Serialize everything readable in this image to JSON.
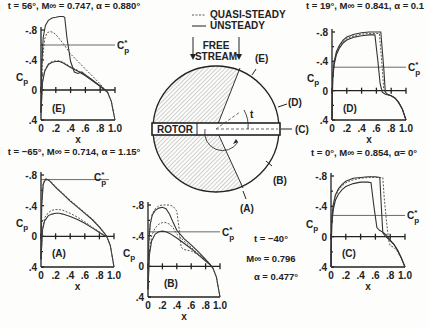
{
  "legend": {
    "quasi_steady": "QUASI-STEADY",
    "unsteady": "UNSTEADY"
  },
  "diagram": {
    "free_stream_line1": "FREE",
    "free_stream_line2": "STREAM",
    "rotor_label": "ROTOR",
    "azimuth_label": "t",
    "stations": [
      "(A)",
      "(B)",
      "(C)",
      "(D)",
      "(E)"
    ]
  },
  "chart_data": [
    {
      "type": "line",
      "panel": "(E)",
      "title": "t = 56°, M∞ = 0.747, α = 0.880°",
      "xlabel": "x",
      "ylabel": "Cp",
      "xlim": [
        0,
        1.0
      ],
      "ylim": [
        0.4,
        -0.8
      ],
      "xticks": [
        "0",
        ".2",
        ".4",
        ".6",
        ".8",
        "1.0"
      ],
      "yticks": [
        "-.8",
        "-.4",
        "0",
        ".4"
      ],
      "cp_star": -0.6,
      "cp_star_label": "C*p",
      "series": [
        {
          "name": "UNSTEADY upper",
          "x": [
            0,
            0.01,
            0.03,
            0.06,
            0.1,
            0.15,
            0.2,
            0.25,
            0.3,
            0.32,
            0.35,
            0.4,
            0.45,
            0.5,
            0.55,
            0.6,
            0.7,
            0.8,
            0.85,
            0.9,
            0.95,
            1.0
          ],
          "y": [
            0.3,
            -0.3,
            -0.7,
            -0.86,
            -0.93,
            -0.96,
            -0.97,
            -0.98,
            -0.98,
            -0.97,
            -0.7,
            -0.38,
            -0.24,
            -0.22,
            -0.24,
            -0.2,
            -0.13,
            -0.05,
            -0.01,
            0.03,
            0.15,
            0.4
          ]
        },
        {
          "name": "QUASI-STEADY upper",
          "x": [
            0,
            0.02,
            0.05,
            0.08,
            0.12,
            0.16,
            0.2,
            0.3,
            0.4,
            0.5,
            0.6,
            0.7,
            0.8,
            0.85,
            0.9,
            0.95,
            1.0
          ],
          "y": [
            0.3,
            -0.4,
            -0.68,
            -0.76,
            -0.78,
            -0.77,
            -0.74,
            -0.62,
            -0.48,
            -0.38,
            -0.28,
            -0.18,
            -0.08,
            -0.02,
            0.03,
            0.15,
            0.4
          ]
        },
        {
          "name": "UNSTEADY lower",
          "x": [
            0,
            0.02,
            0.05,
            0.1,
            0.15,
            0.2,
            0.25,
            0.3,
            0.4,
            0.5,
            0.6,
            0.7,
            0.8,
            0.85,
            0.9
          ],
          "y": [
            0.3,
            -0.1,
            -0.25,
            -0.34,
            -0.37,
            -0.38,
            -0.38,
            -0.36,
            -0.3,
            -0.25,
            -0.19,
            -0.12,
            -0.05,
            -0.01,
            0.03
          ]
        },
        {
          "name": "QUASI-STEADY lower",
          "x": [
            0,
            0.02,
            0.05,
            0.1,
            0.15,
            0.2,
            0.25,
            0.3,
            0.4,
            0.5,
            0.6,
            0.7,
            0.8,
            0.85,
            0.9
          ],
          "y": [
            0.3,
            -0.11,
            -0.26,
            -0.35,
            -0.38,
            -0.39,
            -0.39,
            -0.37,
            -0.31,
            -0.26,
            -0.2,
            -0.13,
            -0.06,
            -0.02,
            0.03
          ]
        }
      ]
    },
    {
      "type": "line",
      "panel": "(D)",
      "title": "t = 19°, M∞ = 0.841, α = 0.1",
      "xlabel": "x",
      "ylabel": "Cp",
      "xlim": [
        0,
        1.0
      ],
      "ylim": [
        0.4,
        -0.8
      ],
      "xticks": [
        "0",
        ".2",
        ".4",
        ".6",
        ".8",
        "1.0"
      ],
      "yticks": [
        "-.8",
        "-.4",
        "0",
        ".4"
      ],
      "cp_star": -0.32,
      "cp_star_label": "C*p",
      "series": [
        {
          "name": "UNSTEADY outer",
          "x": [
            0,
            0.01,
            0.03,
            0.06,
            0.1,
            0.15,
            0.2,
            0.3,
            0.4,
            0.5,
            0.6,
            0.66,
            0.7,
            0.72,
            0.75,
            0.8,
            0.85,
            0.9,
            0.95,
            1.0
          ],
          "y": [
            0.4,
            -0.2,
            -0.4,
            -0.53,
            -0.62,
            -0.69,
            -0.73,
            -0.77,
            -0.79,
            -0.8,
            -0.8,
            -0.8,
            -0.3,
            0.02,
            0.05,
            0.07,
            0.1,
            0.16,
            0.25,
            0.4
          ]
        },
        {
          "name": "QUASI-STEADY",
          "x": [
            0,
            0.01,
            0.03,
            0.06,
            0.1,
            0.15,
            0.2,
            0.3,
            0.4,
            0.5,
            0.6,
            0.64,
            0.68,
            0.7,
            0.75,
            0.8,
            0.85,
            0.9,
            0.95,
            1.0
          ],
          "y": [
            0.4,
            -0.18,
            -0.38,
            -0.51,
            -0.6,
            -0.67,
            -0.71,
            -0.75,
            -0.77,
            -0.78,
            -0.78,
            -0.78,
            -0.3,
            0.0,
            0.05,
            0.07,
            0.1,
            0.16,
            0.25,
            0.4
          ]
        },
        {
          "name": "UNSTEADY inner",
          "x": [
            0,
            0.01,
            0.03,
            0.06,
            0.1,
            0.15,
            0.2,
            0.3,
            0.4,
            0.5,
            0.58,
            0.62,
            0.65,
            0.68,
            0.72,
            0.8,
            0.85,
            0.9,
            0.95,
            1.0
          ],
          "y": [
            0.4,
            -0.16,
            -0.36,
            -0.49,
            -0.58,
            -0.65,
            -0.69,
            -0.73,
            -0.75,
            -0.76,
            -0.76,
            -0.4,
            -0.1,
            0.02,
            0.05,
            0.07,
            0.1,
            0.16,
            0.25,
            0.4
          ]
        }
      ]
    },
    {
      "type": "line",
      "panel": "(A)",
      "title": "t = −65°, M∞ = 0.714, α = 1.15°",
      "xlabel": "x",
      "ylabel": "Cp",
      "xlim": [
        0,
        1.0
      ],
      "ylim": [
        0.4,
        -0.8
      ],
      "xticks": [
        "0",
        ".2",
        ".4",
        ".6",
        ".8",
        "1.0"
      ],
      "yticks": [
        "-.8",
        "-.4",
        "0",
        ".4"
      ],
      "cp_star": -0.74,
      "cp_star_label": "C*p",
      "series": [
        {
          "name": "UNSTEADY upper",
          "x": [
            0,
            0.01,
            0.03,
            0.06,
            0.09,
            0.12,
            0.2,
            0.3,
            0.4,
            0.5,
            0.6,
            0.7,
            0.8,
            0.85,
            0.9,
            0.95,
            1.0
          ],
          "y": [
            0.3,
            -0.4,
            -0.68,
            -0.74,
            -0.74,
            -0.72,
            -0.64,
            -0.55,
            -0.46,
            -0.38,
            -0.3,
            -0.22,
            -0.12,
            -0.06,
            0.0,
            0.12,
            0.4
          ]
        },
        {
          "name": "QUASI-STEADY upper",
          "x": [
            0,
            0.01,
            0.03,
            0.06,
            0.09,
            0.12,
            0.2,
            0.3,
            0.4,
            0.5,
            0.6,
            0.7,
            0.8,
            0.85,
            0.9,
            0.95,
            1.0
          ],
          "y": [
            0.3,
            -0.42,
            -0.69,
            -0.75,
            -0.75,
            -0.73,
            -0.65,
            -0.56,
            -0.47,
            -0.39,
            -0.31,
            -0.23,
            -0.13,
            -0.07,
            0.0,
            0.12,
            0.4
          ]
        },
        {
          "name": "UNSTEADY lower",
          "x": [
            0,
            0.02,
            0.05,
            0.1,
            0.15,
            0.2,
            0.25,
            0.3,
            0.4,
            0.5,
            0.6,
            0.7,
            0.8,
            0.85,
            0.9
          ],
          "y": [
            0.3,
            -0.08,
            -0.2,
            -0.27,
            -0.29,
            -0.3,
            -0.3,
            -0.29,
            -0.26,
            -0.22,
            -0.17,
            -0.11,
            -0.05,
            -0.02,
            0.01
          ]
        },
        {
          "name": "QUASI-STEADY lower",
          "x": [
            0,
            0.02,
            0.05,
            0.1,
            0.15,
            0.2,
            0.25,
            0.3,
            0.4,
            0.5,
            0.6,
            0.7,
            0.8,
            0.85,
            0.9
          ],
          "y": [
            0.3,
            -0.1,
            -0.24,
            -0.31,
            -0.34,
            -0.35,
            -0.35,
            -0.34,
            -0.3,
            -0.25,
            -0.19,
            -0.12,
            -0.06,
            -0.02,
            0.01
          ]
        }
      ]
    },
    {
      "type": "line",
      "panel": "(B)",
      "title": "t = −40°",
      "subtitle": [
        "M∞ = 0.796",
        "α = 0.477°"
      ],
      "xlabel": "x",
      "ylabel": "Cp",
      "xlim": [
        0,
        1.0
      ],
      "ylim": [
        0.4,
        -0.8
      ],
      "xticks": [
        "0",
        ".2",
        ".4",
        ".6",
        ".8",
        "1.0"
      ],
      "yticks": [
        "-.8",
        "-.4",
        "0",
        ".4"
      ],
      "cp_star": -0.45,
      "cp_star_label": "C*p",
      "series": [
        {
          "name": "UNSTEADY upper",
          "x": [
            0,
            0.01,
            0.03,
            0.06,
            0.1,
            0.15,
            0.2,
            0.25,
            0.3,
            0.35,
            0.4,
            0.5,
            0.6,
            0.7,
            0.8,
            0.85,
            0.9,
            0.95,
            1.0
          ],
          "y": [
            0.3,
            -0.3,
            -0.55,
            -0.67,
            -0.73,
            -0.76,
            -0.77,
            -0.75,
            -0.68,
            -0.57,
            -0.47,
            -0.36,
            -0.28,
            -0.19,
            -0.09,
            -0.04,
            0.02,
            0.14,
            0.4
          ]
        },
        {
          "name": "QUASI-STEADY upper",
          "x": [
            0,
            0.01,
            0.03,
            0.06,
            0.1,
            0.15,
            0.2,
            0.25,
            0.3,
            0.35,
            0.4,
            0.43,
            0.46,
            0.5,
            0.6,
            0.7,
            0.8,
            0.85,
            0.9,
            0.95,
            1.0
          ],
          "y": [
            0.3,
            -0.3,
            -0.55,
            -0.68,
            -0.75,
            -0.79,
            -0.8,
            -0.8,
            -0.8,
            -0.78,
            -0.72,
            -0.5,
            -0.25,
            -0.22,
            -0.2,
            -0.15,
            -0.08,
            -0.03,
            0.02,
            0.14,
            0.4
          ]
        },
        {
          "name": "UNSTEADY lower",
          "x": [
            0,
            0.02,
            0.05,
            0.1,
            0.15,
            0.2,
            0.25,
            0.3,
            0.4,
            0.5,
            0.6,
            0.7,
            0.8,
            0.85,
            0.9
          ],
          "y": [
            0.3,
            -0.15,
            -0.33,
            -0.42,
            -0.45,
            -0.46,
            -0.45,
            -0.43,
            -0.37,
            -0.3,
            -0.23,
            -0.15,
            -0.07,
            -0.03,
            0.02
          ]
        },
        {
          "name": "QUASI-STEADY lower",
          "x": [
            0,
            0.02,
            0.05,
            0.1,
            0.15,
            0.2,
            0.25,
            0.3,
            0.35,
            0.4,
            0.5,
            0.6,
            0.7,
            0.8,
            0.85,
            0.9
          ],
          "y": [
            0.3,
            -0.18,
            -0.4,
            -0.5,
            -0.55,
            -0.57,
            -0.57,
            -0.55,
            -0.5,
            -0.42,
            -0.33,
            -0.25,
            -0.16,
            -0.08,
            -0.03,
            0.02
          ]
        }
      ]
    },
    {
      "type": "line",
      "panel": "(C)",
      "title": "t = 0°, M∞ = 0.854, α= 0°",
      "xlabel": "x",
      "ylabel": "Cp",
      "xlim": [
        0,
        1.0
      ],
      "ylim": [
        0.4,
        -0.8
      ],
      "xticks": [
        "0",
        ".2",
        ".4",
        ".6",
        ".8",
        "1.0"
      ],
      "yticks": [
        "-.8",
        "-.4",
        "0",
        ".4"
      ],
      "cp_star": -0.28,
      "cp_star_label": "C*p",
      "series": [
        {
          "name": "UNSTEADY outer",
          "x": [
            0,
            0.01,
            0.03,
            0.06,
            0.1,
            0.15,
            0.2,
            0.3,
            0.4,
            0.5,
            0.6,
            0.66,
            0.68,
            0.7,
            0.74,
            0.8,
            0.85,
            0.9,
            0.95,
            1.0
          ],
          "y": [
            0.4,
            -0.2,
            -0.42,
            -0.55,
            -0.63,
            -0.69,
            -0.73,
            -0.77,
            -0.78,
            -0.79,
            -0.79,
            -0.78,
            -0.4,
            -0.05,
            0.0,
            0.05,
            0.1,
            0.18,
            0.28,
            0.4
          ]
        },
        {
          "name": "QUASI-STEADY",
          "x": [
            0,
            0.01,
            0.03,
            0.06,
            0.1,
            0.15,
            0.2,
            0.3,
            0.4,
            0.5,
            0.6,
            0.7,
            0.72,
            0.75,
            0.78,
            0.8,
            0.85,
            0.9,
            0.95,
            1.0
          ],
          "y": [
            0.4,
            -0.18,
            -0.4,
            -0.53,
            -0.61,
            -0.67,
            -0.71,
            -0.75,
            -0.77,
            -0.78,
            -0.78,
            -0.78,
            -0.5,
            -0.2,
            0.05,
            0.12,
            0.14,
            0.2,
            0.28,
            0.4
          ]
        },
        {
          "name": "UNSTEADY inner",
          "x": [
            0,
            0.01,
            0.03,
            0.06,
            0.1,
            0.15,
            0.2,
            0.3,
            0.4,
            0.5,
            0.54,
            0.58,
            0.62,
            0.66,
            0.7,
            0.75,
            0.8,
            0.85,
            0.9,
            0.95,
            1.0
          ],
          "y": [
            0.4,
            -0.15,
            -0.35,
            -0.48,
            -0.56,
            -0.62,
            -0.66,
            -0.7,
            -0.72,
            -0.72,
            -0.71,
            -0.4,
            -0.12,
            -0.08,
            -0.06,
            -0.02,
            0.05,
            0.1,
            0.18,
            0.28,
            0.4
          ]
        }
      ]
    }
  ]
}
